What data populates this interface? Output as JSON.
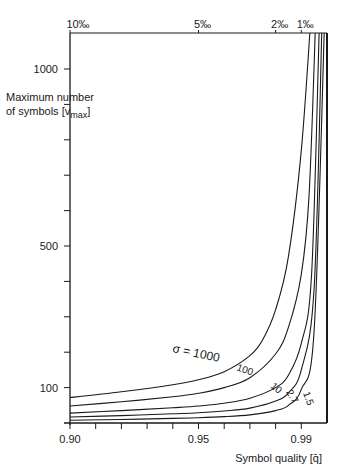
{
  "chart_data": {
    "type": "line",
    "title": "",
    "xlabel": "Symbol quality [q̄]",
    "ylabel": "Maximum number of symbols [v_max]",
    "ylabel_lines": [
      "Maximum number",
      "of symbols [v",
      "max",
      "]"
    ],
    "xlim": [
      0.9,
      1.0
    ],
    "ylim": [
      0,
      1000
    ],
    "x_ticks": [
      0.9,
      0.91,
      0.92,
      0.93,
      0.94,
      0.95,
      0.96,
      0.97,
      0.98,
      0.99,
      1.0
    ],
    "x_tick_labels": [
      {
        "value": 0.9,
        "label": "0.90"
      },
      {
        "value": 0.95,
        "label": "0.95"
      },
      {
        "value": 0.99,
        "label": "0.99"
      }
    ],
    "y_ticks": [
      0,
      100,
      200,
      300,
      400,
      500,
      600,
      700,
      800,
      900,
      1000
    ],
    "y_tick_labels": [
      {
        "value": 100,
        "label": "100"
      },
      {
        "value": 500,
        "label": "500"
      },
      {
        "value": 1000,
        "label": "1000"
      }
    ],
    "top_axis_labels": [
      {
        "value": 0.9,
        "label": "10‰"
      },
      {
        "value": 0.95,
        "label": "5‰"
      },
      {
        "value": 0.98,
        "label": "2‰"
      },
      {
        "value": 0.99,
        "label": "1‰"
      }
    ],
    "grid": false,
    "legend": "inline curve labels",
    "series": [
      {
        "name": "σ = 1000",
        "label": "σ = 1000",
        "x": [
          0.9,
          0.92,
          0.94,
          0.95,
          0.96,
          0.97,
          0.975,
          0.98,
          0.985,
          0.99,
          0.9935
        ],
        "y": [
          72,
          88,
          108,
          122,
          145,
          190,
          235,
          320,
          470,
          770,
          1120
        ]
      },
      {
        "name": "σ = 100",
        "label": "100",
        "x": [
          0.9,
          0.92,
          0.94,
          0.95,
          0.96,
          0.97,
          0.98,
          0.985,
          0.99,
          0.993,
          0.9955
        ],
        "y": [
          48,
          60,
          74,
          84,
          100,
          128,
          195,
          270,
          420,
          640,
          1120
        ]
      },
      {
        "name": "σ = 10",
        "label": "10",
        "x": [
          0.9,
          0.92,
          0.94,
          0.95,
          0.96,
          0.97,
          0.98,
          0.985,
          0.99,
          0.994,
          0.997
        ],
        "y": [
          28,
          35,
          43,
          48,
          56,
          70,
          100,
          135,
          225,
          420,
          1120
        ]
      },
      {
        "name": "σ = 2.7",
        "label": "2.7",
        "x": [
          0.9,
          0.92,
          0.94,
          0.95,
          0.96,
          0.97,
          0.98,
          0.985,
          0.99,
          0.995,
          0.998
        ],
        "y": [
          17,
          21,
          26,
          29,
          34,
          42,
          62,
          85,
          150,
          380,
          1120
        ]
      },
      {
        "name": "σ = 1.5",
        "label": "1.5",
        "x": [
          0.9,
          0.92,
          0.94,
          0.95,
          0.96,
          0.97,
          0.98,
          0.985,
          0.99,
          0.995,
          0.999
        ],
        "y": [
          8,
          10,
          13,
          15,
          18,
          23,
          35,
          50,
          95,
          260,
          1120
        ]
      }
    ]
  }
}
